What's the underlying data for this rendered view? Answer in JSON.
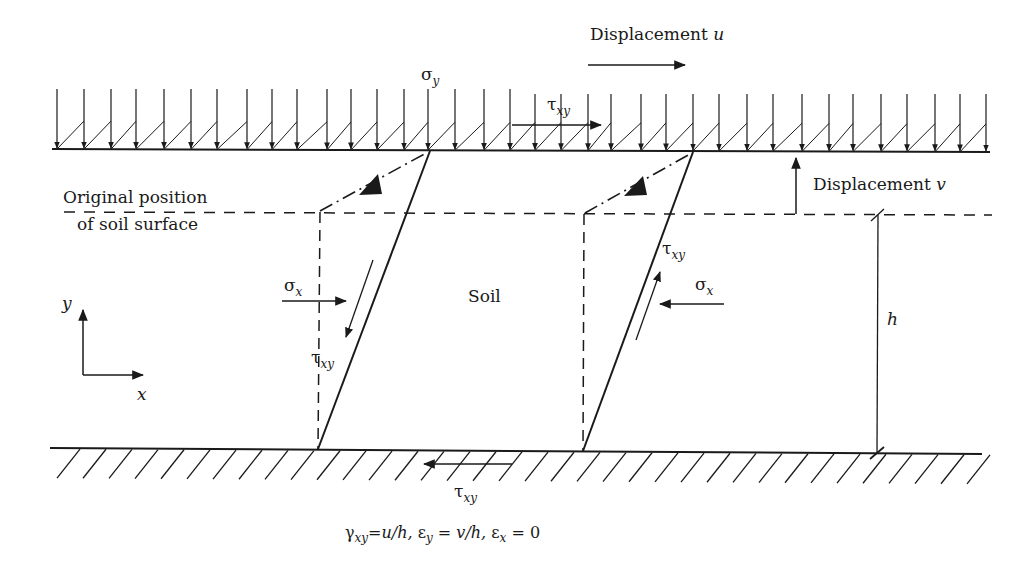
{
  "diagram": {
    "colors": {
      "ink": "#1a1a1a",
      "background": "#ffffff"
    },
    "labels": {
      "displacement_u": {
        "text": "Displacement ",
        "var": "u"
      },
      "displacement_v": {
        "text": "Displacement ",
        "var": "v"
      },
      "original_position_line1": "Original position",
      "original_position_line2": "of soil surface",
      "soil": "Soil",
      "sigma_y": {
        "sym": "σ",
        "sub": "y"
      },
      "tau_xy_top": {
        "sym": "τ",
        "sub": "xy"
      },
      "sigma_x_left": {
        "sym": "σ",
        "sub": "x"
      },
      "tau_xy_left": {
        "sym": "τ",
        "sub": "xy"
      },
      "sigma_x_right": {
        "sym": "σ",
        "sub": "x"
      },
      "tau_xy_right": {
        "sym": "τ",
        "sub": "xy"
      },
      "tau_xy_bottom": {
        "sym": "τ",
        "sub": "xy"
      },
      "h": "h",
      "axis_x": "x",
      "axis_y": "y"
    },
    "equation": {
      "gamma": "γ",
      "gamma_sub": "xy",
      "gamma_rhs": "=u/h, ",
      "eps_y": "ε",
      "eps_y_sub": "y",
      "eps_y_rhs": " = v/h, ",
      "eps_x": "ε",
      "eps_x_sub": "x",
      "eps_x_rhs": " = 0"
    },
    "load_arrow_x": [
      57,
      84,
      111,
      136,
      164,
      191,
      217,
      247,
      272,
      297,
      327,
      351,
      377,
      404,
      428,
      455,
      484,
      510,
      535,
      561,
      588,
      611,
      641,
      666,
      693,
      719,
      747,
      773,
      802,
      829,
      853,
      881,
      907,
      935,
      960,
      986
    ],
    "ground_hatch_x": [
      60,
      86,
      112,
      138,
      164,
      190,
      216,
      242,
      268,
      294,
      320,
      346,
      372,
      398,
      424,
      450,
      476,
      502,
      528,
      554,
      580,
      606,
      632,
      658,
      684,
      710,
      736,
      762,
      788,
      814,
      840,
      866,
      892,
      918,
      944,
      970
    ]
  }
}
